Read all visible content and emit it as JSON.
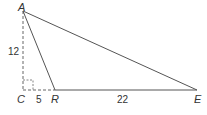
{
  "diagram": {
    "type": "geometry-triangle",
    "points": {
      "A": {
        "label": "A",
        "x": 23,
        "y": 11
      },
      "C": {
        "label": "C",
        "x": 23,
        "y": 90
      },
      "R": {
        "label": "R",
        "x": 55,
        "y": 90
      },
      "E": {
        "label": "E",
        "x": 197,
        "y": 90
      }
    },
    "segments": [
      {
        "from": "A",
        "to": "C",
        "style": "dashed",
        "length_label": "12"
      },
      {
        "from": "C",
        "to": "R",
        "style": "dashed",
        "length_label": "5"
      },
      {
        "from": "R",
        "to": "E",
        "style": "solid",
        "length_label": "22"
      },
      {
        "from": "A",
        "to": "R",
        "style": "solid"
      },
      {
        "from": "A",
        "to": "E",
        "style": "solid"
      }
    ],
    "right_angle_at": "C",
    "labels": {
      "A": "A",
      "C": "C",
      "R": "R",
      "E": "E",
      "AC": "12",
      "CR": "5",
      "RE": "22"
    },
    "colors": {
      "line": "#555555",
      "text": "#333333"
    }
  }
}
